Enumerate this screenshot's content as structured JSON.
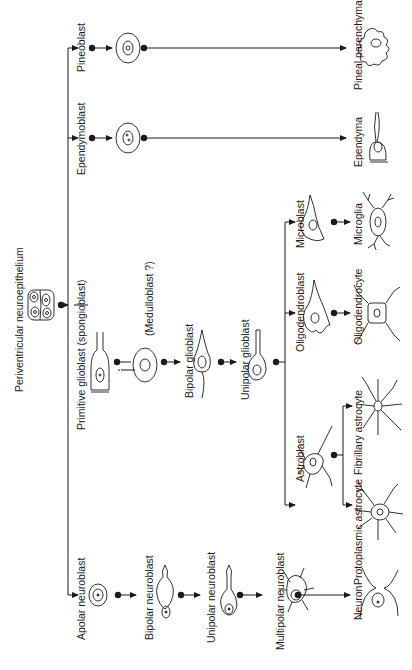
{
  "diagram": {
    "orientation": "rotated-90-ccw",
    "root": "Periventricular neuroepithelium",
    "labels": {
      "root": "Periventricular neuroepithelium",
      "pineoblast": "Pineoblast",
      "pineal_parenchyma": "Pineal parenchyma",
      "ependymoblast": "Ependymoblast",
      "ependyma": "Ependyma",
      "primitive_glioblast": "Primitive glioblast (spongioblast)",
      "medulloblast": "(Medulloblast ?)",
      "bipolar_glioblast": "Bipolar glioblast",
      "unipolar_glioblast": "Unipolar glioblast",
      "microblast": "Microblast",
      "microglia": "Microglia",
      "oligodendroblast": "Oligodendroblast",
      "oligodendrocyte": "Oligodendrocyte",
      "astroblast": "Astroblast",
      "fibrillary_astrocyte": "Fibrillary astrocyte",
      "protoplasmic_astrocyte": "Protoplasmic astrocyte",
      "apolar_neuroblast": "Apolar neuroblast",
      "bipolar_neuroblast": "Bipolar neuroblast",
      "unipolar_neuroblast": "Unipolar neuroblast",
      "multipolar_neuroblast": "Multipolar neuroblast",
      "neuron": "Neuron"
    },
    "lineages": [
      {
        "name": "Pineal",
        "stages": [
          "Pineoblast",
          "Pineal parenchyma"
        ]
      },
      {
        "name": "Ependymal",
        "stages": [
          "Ependymoblast",
          "Ependyma"
        ]
      },
      {
        "name": "Glial",
        "stages": [
          "Primitive glioblast (spongioblast)",
          "(Medulloblast ?)",
          "Bipolar glioblast",
          "Unipolar glioblast"
        ],
        "branches": [
          {
            "stages": [
              "Microblast",
              "Microglia"
            ]
          },
          {
            "stages": [
              "Oligodendroblast",
              "Oligodendrocyte"
            ]
          },
          {
            "stages": [
              "Astroblast"
            ],
            "branches": [
              {
                "stages": [
                  "Fibrillary astrocyte"
                ]
              },
              {
                "stages": [
                  "Protoplasmic astrocyte"
                ]
              }
            ]
          }
        ]
      },
      {
        "name": "Neuronal",
        "stages": [
          "Apolar neuroblast",
          "Bipolar neuroblast",
          "Unipolar neuroblast",
          "Multipolar neuroblast",
          "Neuron"
        ]
      }
    ]
  }
}
